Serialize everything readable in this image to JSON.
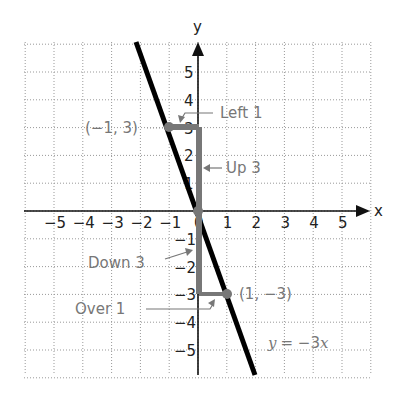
{
  "chart_data": {
    "type": "line",
    "title": "",
    "xlabel": "x",
    "ylabel": "y",
    "xlim": [
      -6,
      6
    ],
    "ylim": [
      -6,
      6
    ],
    "grid": true,
    "x_ticks": [
      "−5",
      "−4",
      "−3",
      "−2",
      "−1",
      "0",
      "1",
      "2",
      "3",
      "4",
      "5"
    ],
    "y_ticks": [
      "5",
      "4",
      "3",
      "2",
      "1",
      "−1",
      "−2",
      "−3",
      "−4",
      "−5"
    ],
    "series": [
      {
        "name": "y = −3x",
        "equation": "y = -3x",
        "slope": -3,
        "intercept": 0,
        "color": "#000000"
      }
    ],
    "points": [
      {
        "x": -1,
        "y": 3,
        "label": "(−1, 3)"
      },
      {
        "x": 0,
        "y": 0,
        "label": ""
      },
      {
        "x": 1,
        "y": -3,
        "label": "(1, −3)"
      }
    ],
    "annotations": [
      {
        "text": "Left 1",
        "from": [
          0,
          3
        ],
        "to": [
          -1,
          3
        ]
      },
      {
        "text": "Up 3",
        "from": [
          0,
          0
        ],
        "to": [
          0,
          3
        ]
      },
      {
        "text": "Down 3",
        "from": [
          0,
          0
        ],
        "to": [
          0,
          -3
        ]
      },
      {
        "text": "Over 1",
        "from": [
          0,
          -3
        ],
        "to": [
          1,
          -3
        ]
      }
    ],
    "equation_label": "y = −3x"
  },
  "labels": {
    "x_axis": "x",
    "y_axis": "y",
    "point_a": "(−1, 3)",
    "point_b": "(1, −3)",
    "left": "Left 1",
    "up": "Up 3",
    "down": "Down 3",
    "over": "Over 1",
    "eq_y": "y",
    "eq_rest": "= −3",
    "eq_x": "x"
  },
  "colors": {
    "line": "#000000",
    "path": "#777777",
    "grid": "#999999",
    "annotation": "#777777"
  }
}
